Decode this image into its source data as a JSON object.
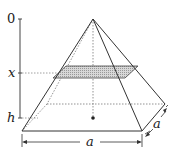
{
  "diagram": {
    "axis_labels": {
      "top": "0",
      "middle": "x",
      "bottom": "h"
    },
    "dimension_labels": {
      "base_front": "a",
      "base_side": "a"
    },
    "colors": {
      "line": "#333333",
      "dotted": "#777777",
      "cross_section_fill": "#c8c8c8"
    }
  }
}
